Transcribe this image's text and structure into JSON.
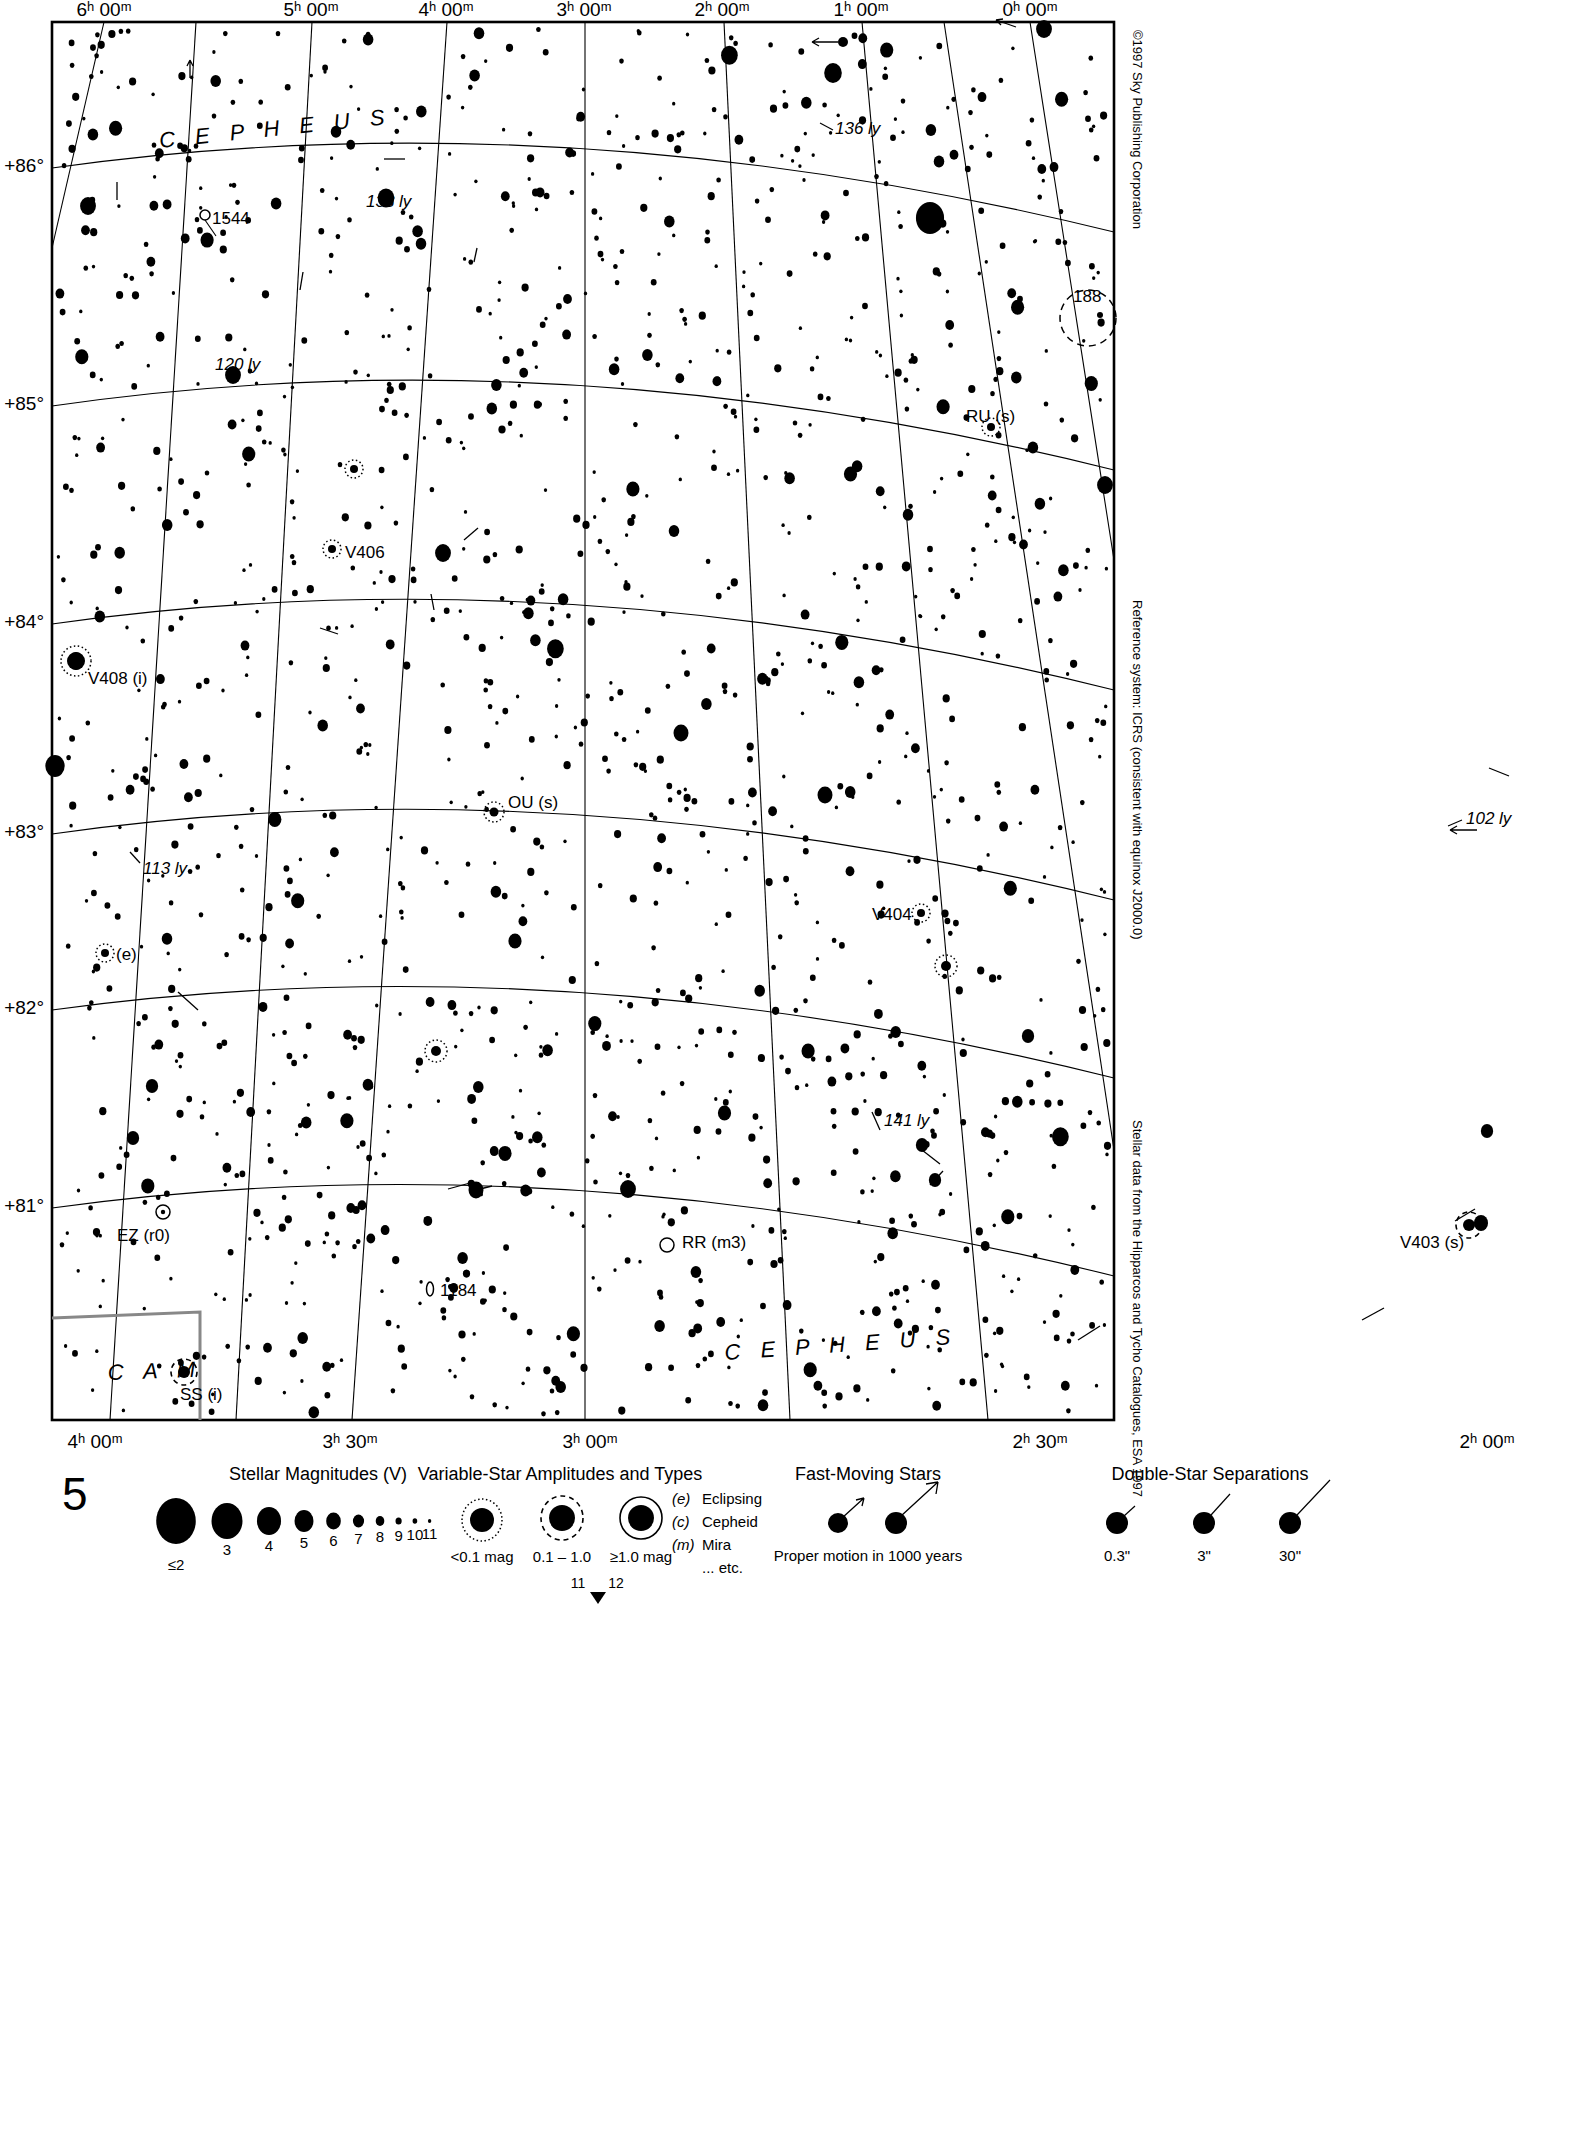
{
  "chart_data": {
    "type": "scatter",
    "projection": "conic, RA/Dec grid",
    "xlabel": "Right Ascension (J2000.0)",
    "ylabel": "Declination",
    "xlim": [
      "6h 00m",
      "0h 00m"
    ],
    "ylim": [
      "+80.5°",
      "+86.5°"
    ],
    "grid": true,
    "legend_position": "below chart",
    "ra_ticks_top": [
      "6ʰ 00ᵐ",
      "5ʰ 00ᵐ",
      "4ʰ 00ᵐ",
      "3ʰ 00ᵐ",
      "2ʰ 00ᵐ",
      "1ʰ 00ᵐ",
      "0ʰ 00ᵐ"
    ],
    "ra_ticks_bottom": [
      "4ʰ 00ᵐ",
      "3ʰ 30ᵐ",
      "3ʰ 00ᵐ",
      "2ʰ 30ᵐ",
      "2ʰ 00ᵐ"
    ],
    "dec_ticks": [
      "+86°",
      "+85°",
      "+84°",
      "+83°",
      "+82°",
      "+81°"
    ],
    "constellation_labels": [
      "C E P H E U S",
      "C E P H E U S",
      "C A M"
    ],
    "annotations": [
      {
        "text": "1544",
        "kind": "open-cluster"
      },
      {
        "text": "188",
        "kind": "open-cluster"
      },
      {
        "text": "1184",
        "kind": "open-cluster"
      },
      {
        "text": "136 ly",
        "kind": "distance"
      },
      {
        "text": "133 ly",
        "kind": "distance"
      },
      {
        "text": "120 ly",
        "kind": "distance"
      },
      {
        "text": "113 ly",
        "kind": "distance"
      },
      {
        "text": "102 ly",
        "kind": "distance"
      },
      {
        "text": "141 ly",
        "kind": "distance"
      },
      {
        "text": "V406",
        "kind": "variable-star"
      },
      {
        "text": "V408 (i)",
        "kind": "variable-star"
      },
      {
        "text": "V404",
        "kind": "variable-star"
      },
      {
        "text": "V403 (s)",
        "kind": "variable-star"
      },
      {
        "text": "OU (s)",
        "kind": "variable-star"
      },
      {
        "text": "RU (s)",
        "kind": "variable-star"
      },
      {
        "text": "RR (m3)",
        "kind": "variable-star"
      },
      {
        "text": "EZ (r0)",
        "kind": "variable-star"
      },
      {
        "text": "SS (i)",
        "kind": "variable-star"
      },
      {
        "text": "(e)",
        "kind": "variable-star"
      }
    ]
  },
  "chart": {
    "page_number": "5",
    "ra_top": [
      {
        "label": "6ʰ 00ᵐ",
        "x": 104
      },
      {
        "label": "5ʰ 00ᵐ",
        "x": 311
      },
      {
        "label": "4ʰ 00ᵐ",
        "x": 446
      },
      {
        "label": "3ʰ 00ᵐ",
        "x": 584
      },
      {
        "label": "2ʰ 00ᵐ",
        "x": 722
      },
      {
        "label": "1ʰ 00ᵐ",
        "x": 861
      },
      {
        "label": "0ʰ 00ᵐ",
        "x": 1030
      }
    ],
    "ra_bottom": [
      {
        "label": "4ʰ 00ᵐ",
        "x": 95
      },
      {
        "label": "3ʰ 30ᵐ",
        "x": 350
      },
      {
        "label": "3ʰ 00ᵐ",
        "x": 590
      },
      {
        "label": "2ʰ 30ᵐ",
        "x": 1040
      },
      {
        "label": "2ʰ 00ᵐ",
        "x": 1480
      }
    ],
    "dec_labels": [
      {
        "label": "+86°",
        "y": 165
      },
      {
        "label": "+85°",
        "y": 403
      },
      {
        "label": "+84°",
        "y": 623
      },
      {
        "label": "+83°",
        "y": 833
      },
      {
        "label": "+82°",
        "y": 1007
      },
      {
        "label": "+81°",
        "y": 1205
      }
    ],
    "constellations": [
      {
        "name": "C E P H E U S",
        "x": 160,
        "y": 148,
        "rot": -6
      },
      {
        "name": "C E P H E U S",
        "x": 725,
        "y": 1360,
        "rot": -4
      },
      {
        "name": "C A M",
        "x": 110,
        "y": 1378,
        "rot": -2
      }
    ],
    "labels": [
      {
        "text": "1544",
        "x": 212,
        "y": 224,
        "style": "star-lbl"
      },
      {
        "text": "133 ly",
        "x": 366,
        "y": 207,
        "style": "ly-lbl"
      },
      {
        "text": "136 ly",
        "x": 835,
        "y": 130,
        "style": "ly-lbl"
      },
      {
        "text": "188",
        "x": 1075,
        "y": 299,
        "style": "star-lbl"
      },
      {
        "text": "120 ly",
        "x": 215,
        "y": 366,
        "style": "ly-lbl"
      },
      {
        "text": "RU (s)",
        "x": 967,
        "y": 418,
        "style": "star-lbl"
      },
      {
        "text": "V406",
        "x": 345,
        "y": 556,
        "style": "star-lbl"
      },
      {
        "text": "V408 (i)",
        "x": 86,
        "y": 680,
        "style": "star-lbl"
      },
      {
        "text": "OU (s)",
        "x": 510,
        "y": 805,
        "style": "star-lbl"
      },
      {
        "text": "102 ly",
        "x": 1472,
        "y": 822,
        "style": "ly-lbl"
      },
      {
        "text": "113 ly",
        "x": 143,
        "y": 870,
        "style": "ly-lbl"
      },
      {
        "text": "V404",
        "x": 874,
        "y": 917,
        "style": "star-lbl"
      },
      {
        "text": "(e)",
        "x": 115,
        "y": 958,
        "style": "star-lbl"
      },
      {
        "text": "141 ly",
        "x": 884,
        "y": 1123,
        "style": "ly-lbl"
      },
      {
        "text": "EZ (r0)",
        "x": 117,
        "y": 1238,
        "style": "star-lbl"
      },
      {
        "text": "RR (m3)",
        "x": 682,
        "y": 1243,
        "style": "star-lbl"
      },
      {
        "text": "V403 (s)",
        "x": 1414,
        "y": 1244,
        "style": "star-lbl"
      },
      {
        "text": "1184",
        "x": 440,
        "y": 1293,
        "style": "star-lbl"
      },
      {
        "text": "SS (i)",
        "x": 180,
        "y": 1397,
        "style": "star-lbl"
      }
    ],
    "side_notes": [
      {
        "text": "©1997 Sky Publishing Corporation",
        "y": 30
      },
      {
        "text": "Reference system: ICRS (consistent with equinox J2000.0)",
        "y": 600
      },
      {
        "text": "Stellar data from the Hipparcos and Tycho Catalogues, ESA 1997",
        "y": 1120
      }
    ]
  },
  "legend": {
    "magnitudes": {
      "title": "Stellar Magnitudes (V)",
      "entries": [
        {
          "label": "≤2",
          "r": 23
        },
        {
          "label": "3",
          "r": 18
        },
        {
          "label": "4",
          "r": 14
        },
        {
          "label": "5",
          "r": 11
        },
        {
          "label": "6",
          "r": 8.5
        },
        {
          "label": "7",
          "r": 6.5
        },
        {
          "label": "8",
          "r": 5
        },
        {
          "label": "9",
          "r": 3.6
        },
        {
          "label": "10",
          "r": 2.7
        },
        {
          "label": "11",
          "r": 2
        }
      ]
    },
    "variables": {
      "title": "Variable-Star Amplitudes and Types",
      "entries": [
        {
          "label": "<0.1 mag",
          "ring": "dotted"
        },
        {
          "label": "0.1 – 1.0",
          "ring": "dashed"
        },
        {
          "label": "≥1.0 mag",
          "ring": "solid"
        }
      ],
      "types": [
        {
          "code": "(e)",
          "name": "Eclipsing"
        },
        {
          "code": "(c)",
          "name": "Cepheid"
        },
        {
          "code": "(m)",
          "name": "Mira"
        },
        {
          "code": "",
          "name": "... etc."
        }
      ]
    },
    "fast_moving": {
      "title": "Fast-Moving Stars",
      "caption": "Proper motion in 1000 years"
    },
    "doubles": {
      "title": "Double-Star Separations",
      "entries": [
        "0.3\"",
        "3\"",
        "30\""
      ]
    },
    "page_marker": {
      "left": "11",
      "right": "12"
    }
  }
}
